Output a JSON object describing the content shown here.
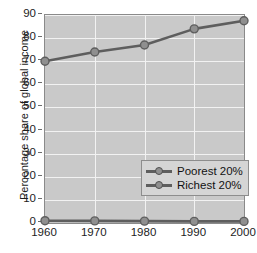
{
  "chart_data": {
    "type": "line",
    "title": "",
    "xlabel": "",
    "ylabel": "Percentage share of global income",
    "x": [
      1960,
      1970,
      1980,
      1990,
      2000
    ],
    "xtick_labels": [
      "1960",
      "1970",
      "1980",
      "1990",
      "2000"
    ],
    "ytick_labels": [
      "0",
      "10",
      "20",
      "30",
      "40",
      "50",
      "60",
      "70",
      "80",
      "90"
    ],
    "yticks": [
      0,
      10,
      20,
      30,
      40,
      50,
      60,
      70,
      80,
      90
    ],
    "ylim": [
      0,
      90
    ],
    "xlim": [
      1960,
      2000
    ],
    "grid": true,
    "legend_position": "center",
    "series": [
      {
        "name": "Poorest 20%",
        "values": [
          1.0,
          0.9,
          0.8,
          0.7,
          0.7
        ],
        "color": "#5e5e5e",
        "marker": "circle",
        "marker_color": "#8f8f8f"
      },
      {
        "name": "Richest 20%",
        "values": [
          70,
          74,
          77,
          84,
          87.5
        ],
        "color": "#5e5e5e",
        "marker": "circle",
        "marker_color": "#8f8f8f"
      }
    ]
  },
  "style": {
    "plot_background": "#c9c9c9",
    "gridline_color": "#f2f2f2",
    "axis_color": "#8a8a8a",
    "text_color": "#1d1d1d",
    "page_background": "#ffffff",
    "legend_background": "#d5d5d5"
  }
}
